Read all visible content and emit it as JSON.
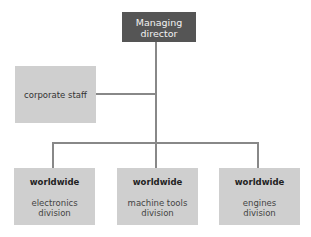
{
  "diagram": {
    "type": "org-chart",
    "top": {
      "label": "Managing director",
      "lines": [
        "Managing",
        "director"
      ]
    },
    "staff": {
      "label": "corporate staff"
    },
    "divisions": [
      {
        "heading": "worldwide",
        "lines": [
          "electronics",
          "division"
        ]
      },
      {
        "heading": "worldwide",
        "lines": [
          "machine tools",
          "division"
        ]
      },
      {
        "heading": "worldwide",
        "lines": [
          "engines",
          "division"
        ]
      }
    ],
    "colors": {
      "top_box": "#555555",
      "boxes": "#cfcfcf",
      "lines": "#888888"
    }
  }
}
